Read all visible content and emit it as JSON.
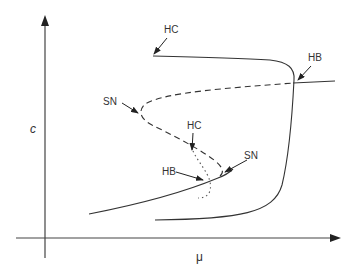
{
  "diagram": {
    "type": "bifurcation-diagram",
    "axes": {
      "x_label": "μ",
      "y_label": "c"
    },
    "annotations": [
      {
        "id": "hc_top",
        "label": "HC"
      },
      {
        "id": "hb_right",
        "label": "HB"
      },
      {
        "id": "sn_left",
        "label": "SN"
      },
      {
        "id": "hc_mid",
        "label": "HC"
      },
      {
        "id": "hb_mid",
        "label": "HB"
      },
      {
        "id": "sn_right",
        "label": "SN"
      }
    ],
    "curves": [
      {
        "name": "stable-lower-branch",
        "style": "solid"
      },
      {
        "name": "unstable-middle-branch",
        "style": "dashed"
      },
      {
        "name": "periodic-orbit-branch",
        "style": "dotted"
      },
      {
        "name": "isola-branch",
        "style": "solid"
      }
    ],
    "colors": {
      "line": "#333333",
      "background": "#ffffff"
    }
  }
}
